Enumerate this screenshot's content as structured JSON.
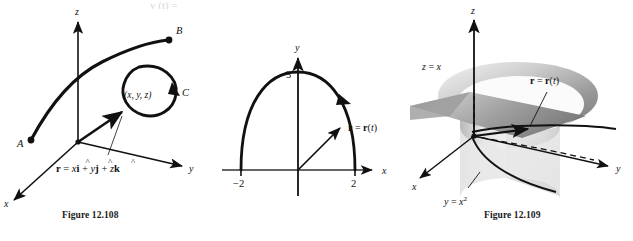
{
  "page": {
    "width": 633,
    "height": 241,
    "background": "#ffffff",
    "ink": "#111111",
    "top_cut_text": "y  (t) ="
  },
  "figures": [
    {
      "id": "fig-108",
      "caption": "Figure 12.108",
      "type": "3d-space-curve",
      "axes": [
        {
          "name": "x-axis",
          "label": "x"
        },
        {
          "name": "y-axis",
          "label": "y"
        },
        {
          "name": "z-axis",
          "label": "z"
        }
      ],
      "labels": {
        "point_a": "A",
        "point_b": "B",
        "curve_c": "C",
        "point_xyz": "(x, y, z)",
        "vector_equation_prefix": "r = x",
        "ihat": "i",
        "jhat": "j",
        "khat": "k",
        "plus": "+",
        "vy": "y",
        "vz": "z",
        "vector_equation_plain": "r = x i + y j + z k"
      }
    },
    {
      "id": "fig-109",
      "caption": "Figure 12.109",
      "type": "2d-semi-ellipse",
      "axes": [
        {
          "name": "x-axis",
          "label": "x"
        },
        {
          "name": "y-axis",
          "label": "y"
        }
      ],
      "ticks": {
        "x_left": "−2",
        "x_right": "2",
        "y_top": "3"
      },
      "labels": {
        "position_vector": "r = r(t)",
        "r_bold": "r",
        "equals": "=",
        "t_param": "t"
      },
      "chart_hint": {
        "semi_axis_x": 2,
        "semi_axis_y": 3,
        "direction": "counterclockwise-to-clockwise-right"
      }
    },
    {
      "id": "fig-110",
      "caption": "Figure 12.110",
      "type": "3d-surface-intersection",
      "axes": [
        {
          "name": "x-axis",
          "label": "x"
        },
        {
          "name": "y-axis",
          "label": "y"
        },
        {
          "name": "z-axis",
          "label": "z"
        }
      ],
      "labels": {
        "plane_surface": "z = x",
        "parabolic_cylinder_base": "y = x",
        "parabolic_cylinder_exp": "2",
        "parabolic_cylinder": "y = x²",
        "position_vector": "r = r(t)",
        "r_bold": "r",
        "t_param": "t"
      }
    }
  ]
}
